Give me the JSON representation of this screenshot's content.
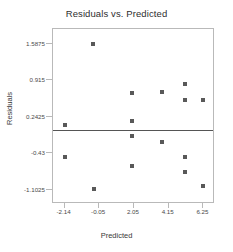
{
  "chart_data": {
    "type": "scatter",
    "title": "Residuals vs. Predicted",
    "xlabel": "Predicted",
    "ylabel": "Residuals",
    "xlim": [
      -2.84,
      6.95
    ],
    "ylim": [
      -1.37,
      1.86
    ],
    "xticks": [
      -2.14,
      -0.05,
      2.05,
      4.15,
      6.25
    ],
    "xtick_labels": [
      "-2.14",
      "-0.05",
      "2.05",
      "4.15",
      "6.25"
    ],
    "yticks": [
      1.5875,
      0.915,
      0.2425,
      -0.43,
      -1.1025
    ],
    "ytick_labels": [
      "1.5875",
      "0.915",
      "0.2425",
      "-0.43",
      "-1.1025"
    ],
    "grid": false,
    "legend": null,
    "reference_line": {
      "orientation": "horizontal",
      "y": 0.0,
      "color": "#555555"
    },
    "marker": {
      "shape": "square",
      "color": "#595959",
      "size": 4
    },
    "points": [
      {
        "x": -2.14,
        "y": 0.08
      },
      {
        "x": -2.14,
        "y": -0.5
      },
      {
        "x": -0.41,
        "y": 1.5875
      },
      {
        "x": -0.38,
        "y": -1.1
      },
      {
        "x": 1.93,
        "y": 0.67
      },
      {
        "x": 1.93,
        "y": 0.16
      },
      {
        "x": 1.95,
        "y": -0.11
      },
      {
        "x": 1.95,
        "y": -0.66
      },
      {
        "x": 3.73,
        "y": 0.69
      },
      {
        "x": 3.75,
        "y": -0.22
      },
      {
        "x": 5.11,
        "y": 0.84
      },
      {
        "x": 5.13,
        "y": 0.55
      },
      {
        "x": 5.13,
        "y": -0.51
      },
      {
        "x": 5.15,
        "y": -0.78
      },
      {
        "x": 6.25,
        "y": 0.55
      },
      {
        "x": 6.25,
        "y": -1.04
      }
    ]
  }
}
